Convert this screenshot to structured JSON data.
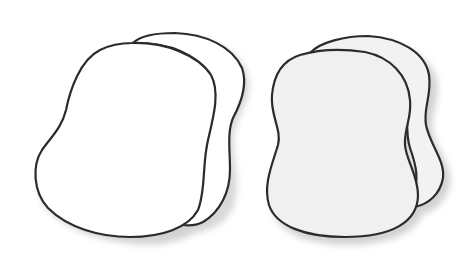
{
  "figure": {
    "description": "Two pairs of overlapping rounded blob shapes with soft drop shadows",
    "colors": {
      "background": "#ffffff",
      "stroke": "#2b2b2b",
      "left_fill": "#ffffff",
      "right_fill": "#f0f0f0",
      "shadow": "#c8c8c8"
    },
    "groups": [
      {
        "id": "left-pair",
        "fill": "white",
        "shapes": [
          "back-blob",
          "front-blob"
        ]
      },
      {
        "id": "right-pair",
        "fill": "light-gray",
        "shapes": [
          "back-blob",
          "front-blob"
        ]
      }
    ]
  }
}
